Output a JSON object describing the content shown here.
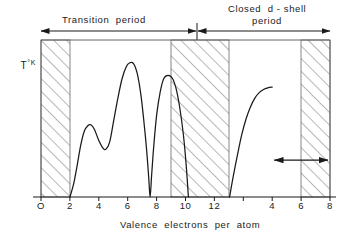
{
  "annotations": {
    "transition_period_label": "Transition  period",
    "closed_dshell_label_line1": "Closed  d - shell",
    "closed_dshell_label_line2": "period"
  },
  "axes": {
    "y_label_text": "T",
    "y_label_unit": "°K",
    "x_caption": "Valence  electrons  per  atom"
  },
  "chart_data": {
    "type": "line",
    "title": "",
    "subtitle": "",
    "xlabel": "Valence electrons per atom",
    "ylabel": "T °K",
    "grid": false,
    "legend": null,
    "xlim": [
      0,
      20
    ],
    "ylim": [
      0,
      1
    ],
    "x_tick_positions": [
      0,
      2,
      4,
      6,
      8,
      10,
      12,
      14,
      16,
      18,
      20
    ],
    "x_tick_labels": [
      "O",
      "2",
      "4",
      "6",
      "8",
      "10",
      "12",
      "",
      "4",
      "6",
      "8"
    ],
    "dual_scale_note": "axis restarts numbering after 12",
    "hatched_bands": [
      {
        "name": "band-left",
        "x_start": 0,
        "x_end": 2
      },
      {
        "name": "band-middle",
        "x_start": 8,
        "x_end": 12
      },
      {
        "name": "band-right",
        "x_start": 16,
        "x_end": 20
      }
    ],
    "period_spans": [
      {
        "label": "Transition  period",
        "x_start": 0,
        "x_end": 10.9
      },
      {
        "label": "Closed  d - shell period",
        "x_start": 10.9,
        "x_end": 20
      }
    ],
    "inner_marker": {
      "name": "double-headed-arrow",
      "x_start": 16,
      "x_end": 20,
      "y": 0.235
    },
    "series": [
      {
        "name": "transition-period-curve",
        "points": [
          [
            2.0,
            0.0
          ],
          [
            2.25,
            0.08
          ],
          [
            2.5,
            0.2
          ],
          [
            2.75,
            0.33
          ],
          [
            3.0,
            0.42
          ],
          [
            3.25,
            0.455
          ],
          [
            3.45,
            0.46
          ],
          [
            3.7,
            0.43
          ],
          [
            4.0,
            0.36
          ],
          [
            4.3,
            0.31
          ],
          [
            4.5,
            0.305
          ],
          [
            4.75,
            0.35
          ],
          [
            5.0,
            0.47
          ],
          [
            5.3,
            0.62
          ],
          [
            5.6,
            0.75
          ],
          [
            5.9,
            0.83
          ],
          [
            6.15,
            0.855
          ],
          [
            6.4,
            0.85
          ],
          [
            6.65,
            0.79
          ],
          [
            6.9,
            0.66
          ],
          [
            7.1,
            0.5
          ],
          [
            7.3,
            0.31
          ],
          [
            7.45,
            0.13
          ],
          [
            7.55,
            0.0
          ],
          [
            7.65,
            0.13
          ],
          [
            7.8,
            0.32
          ],
          [
            8.0,
            0.52
          ],
          [
            8.25,
            0.67
          ],
          [
            8.5,
            0.755
          ],
          [
            8.8,
            0.775
          ],
          [
            9.1,
            0.755
          ],
          [
            9.35,
            0.69
          ],
          [
            9.6,
            0.57
          ],
          [
            9.85,
            0.4
          ],
          [
            10.05,
            0.2
          ],
          [
            10.2,
            0.0
          ]
        ]
      },
      {
        "name": "closed-dshell-curve",
        "points": [
          [
            13.05,
            0.0
          ],
          [
            13.3,
            0.13
          ],
          [
            13.6,
            0.27
          ],
          [
            13.9,
            0.4
          ],
          [
            14.2,
            0.5
          ],
          [
            14.5,
            0.575
          ],
          [
            14.8,
            0.63
          ],
          [
            15.1,
            0.665
          ],
          [
            15.4,
            0.685
          ],
          [
            15.7,
            0.695
          ],
          [
            16.0,
            0.7
          ]
        ]
      }
    ]
  }
}
